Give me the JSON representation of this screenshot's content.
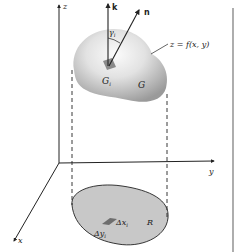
{
  "figure": {
    "labels": {
      "z_axis": "z",
      "y_axis": "y",
      "x_axis": "x",
      "k_vector": "k",
      "n_vector": "n",
      "angle": "γ",
      "angle_sub": "i",
      "surface_eq": "z = f(x, y)",
      "patch": "G",
      "patch_sub": "i",
      "surface": "G",
      "region": "R",
      "dx": "Δx",
      "dx_sub": "i",
      "dy": "Δy",
      "dy_sub": "i"
    },
    "colors": {
      "ink": "#222222",
      "surface_light": "#f4f4f4",
      "surface_dark": "#9a9a9a",
      "region_fill": "#c8c8c8",
      "patch_fill": "#6e6e6e",
      "border": "#777777"
    }
  }
}
